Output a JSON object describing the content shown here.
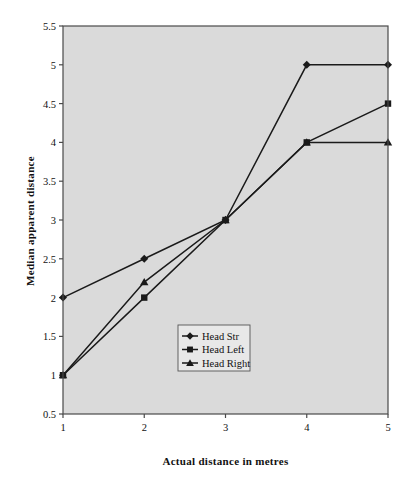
{
  "chart_data": {
    "type": "line",
    "title": "",
    "xlabel": "Actual distance in metres",
    "ylabel": "Median apparent distance",
    "x": [
      1,
      2,
      3,
      4,
      5
    ],
    "xlim": [
      1,
      5
    ],
    "ylim": [
      0.5,
      5.5
    ],
    "xticks": [
      "1",
      "2",
      "3",
      "4",
      "5"
    ],
    "yticks": [
      "0.5",
      "1",
      "1.5",
      "2",
      "2.5",
      "3",
      "3.5",
      "4",
      "4.5",
      "5",
      "5.5"
    ],
    "grid": false,
    "legend_position": "center",
    "series": [
      {
        "name": "Head Str",
        "marker": "diamond",
        "color": "#1a1a1a",
        "values": [
          2,
          2.5,
          3,
          5,
          5
        ]
      },
      {
        "name": "Head Left",
        "marker": "square",
        "color": "#1a1a1a",
        "values": [
          1,
          2,
          3,
          4,
          4.5
        ]
      },
      {
        "name": "Head Right",
        "marker": "triangle",
        "color": "#1a1a1a",
        "values": [
          1,
          2.2,
          3,
          4,
          4
        ]
      }
    ]
  },
  "style": {
    "plot_background": "#d4d4d4",
    "axis_color": "#4a4a4a",
    "line_color": "#1a1a1a",
    "legend_background": "#e8e8e8",
    "legend_border": "#555555",
    "page_background": "#ffffff"
  }
}
